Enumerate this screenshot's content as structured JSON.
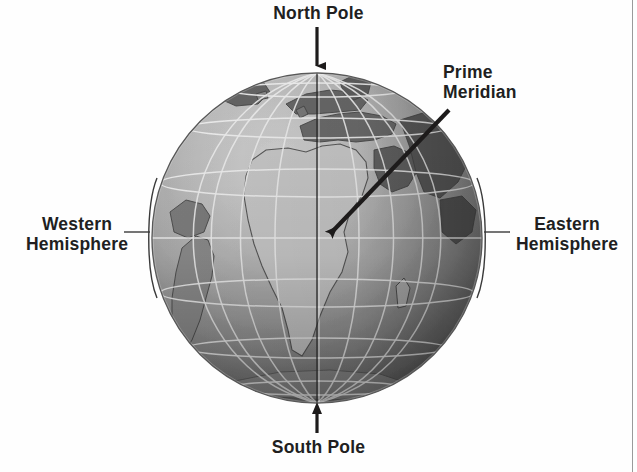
{
  "figure": {
    "background_color": "#fefefe",
    "border_color": "#9a9a9a"
  },
  "labels": {
    "north_pole": "North Pole",
    "south_pole": "South Pole",
    "prime_meridian": "Prime\nMeridian",
    "western_hemisphere": "Western\nHemisphere",
    "eastern_hemisphere": "Eastern\nHemisphere"
  },
  "label_color": "#211f1f",
  "globe": {
    "center_x": 317,
    "center_y": 238,
    "radius": 165,
    "equator_y": 238,
    "prime_meridian_x": 317,
    "graticule_color": "#f2f2f2",
    "land_color": "#6e6e6e",
    "ocean_light": "#b9b9b9",
    "ocean_dark": "#585858",
    "landmasses": [
      "Africa",
      "Europe",
      "Asia",
      "South America",
      "Greenland",
      "Madagascar",
      "Arabian Peninsula"
    ],
    "latitude_lines_deg": [
      60,
      30,
      0,
      -30,
      -60
    ],
    "longitude_spacing_deg": 20
  },
  "callouts": {
    "north_pole_arrow": {
      "name": "north-pole-arrow",
      "direction": "down",
      "from": [
        317,
        27
      ],
      "to": [
        317,
        74
      ]
    },
    "south_pole_arrow": {
      "name": "south-pole-arrow",
      "direction": "up",
      "from": [
        317,
        433
      ],
      "to": [
        317,
        404
      ]
    },
    "prime_meridian_arrow": {
      "name": "prime-meridian-arrow",
      "direction": "down-left",
      "from": [
        449,
        110
      ],
      "to": [
        324,
        239
      ]
    },
    "western_bracket": {
      "name": "western-hemisphere-bracket",
      "arc_x": 150,
      "top_y": 178,
      "bottom_y": 298,
      "tick_y": 232
    },
    "eastern_bracket": {
      "name": "eastern-hemisphere-bracket",
      "arc_x": 484,
      "top_y": 178,
      "bottom_y": 298,
      "tick_y": 232
    }
  }
}
